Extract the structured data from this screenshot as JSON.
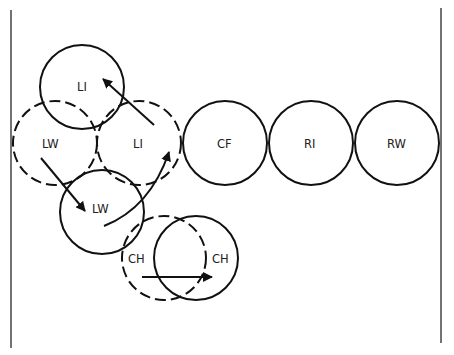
{
  "diagram": {
    "type": "formation-movement",
    "borders": {
      "left": {
        "x": 11,
        "y1": 10,
        "y2": 348
      },
      "right": {
        "x": 441,
        "y1": 8,
        "y2": 343
      }
    },
    "positions": [
      {
        "id": "li-moved",
        "label": "LI",
        "cx": 82,
        "cy": 87,
        "r": 42,
        "style": "solid"
      },
      {
        "id": "lw-original",
        "label": "LW",
        "cx": 55,
        "cy": 143,
        "r": 42,
        "style": "dashed"
      },
      {
        "id": "li-original",
        "label": "LI",
        "cx": 139,
        "cy": 143,
        "r": 42,
        "style": "dashed"
      },
      {
        "id": "cf",
        "label": "CF",
        "cx": 225,
        "cy": 143,
        "r": 42,
        "style": "solid"
      },
      {
        "id": "ri",
        "label": "RI",
        "cx": 311,
        "cy": 143,
        "r": 42,
        "style": "solid"
      },
      {
        "id": "rw",
        "label": "RW",
        "cx": 397,
        "cy": 143,
        "r": 42,
        "style": "solid"
      },
      {
        "id": "lw-moved",
        "label": "LW",
        "cx": 102,
        "cy": 212,
        "r": 42,
        "style": "solid"
      },
      {
        "id": "ch-original",
        "label": "CH",
        "cx": 164,
        "cy": 258,
        "r": 42,
        "style": "dashed"
      },
      {
        "id": "ch-moved",
        "label": "CH",
        "cx": 196,
        "cy": 258,
        "r": 42,
        "style": "solid"
      }
    ],
    "labels": [
      {
        "text": "LI",
        "x": 77,
        "y": 91
      },
      {
        "text": "LW",
        "x": 42,
        "y": 148
      },
      {
        "text": "LI",
        "x": 133,
        "y": 148
      },
      {
        "text": "CF",
        "x": 217,
        "y": 148
      },
      {
        "text": "RI",
        "x": 304,
        "y": 148
      },
      {
        "text": "RW",
        "x": 387,
        "y": 148
      },
      {
        "text": "LW",
        "x": 92,
        "y": 213
      },
      {
        "text": "CH",
        "x": 128,
        "y": 263
      },
      {
        "text": "CH",
        "x": 212,
        "y": 263
      }
    ],
    "movements": [
      {
        "id": "li-forward-left",
        "from": "LI",
        "to": "LI",
        "path": "M154,125 L103,79"
      },
      {
        "id": "lw-back-in",
        "from": "LW",
        "to": "LW",
        "path": "M41,158 L85,211"
      },
      {
        "id": "lw-curve-run",
        "from": "LW",
        "to": "LI",
        "path": "M104,226 Q150,208 169,152"
      },
      {
        "id": "ch-across",
        "from": "CH",
        "to": "CH",
        "path": "M142,277 L212,277"
      }
    ]
  }
}
